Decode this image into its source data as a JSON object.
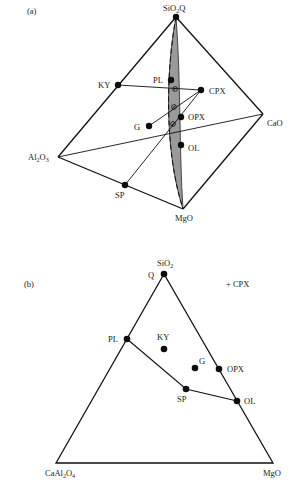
{
  "panel_a": {
    "label": "(a)",
    "title": "CMAS tetrahedron",
    "vertices": {
      "apex": {
        "label": "SiO",
        "sub": "2",
        "suffix": "Q",
        "x": 176,
        "y": 17
      },
      "al2o3": {
        "label": "Al",
        "sub1": "2",
        "mid": "O",
        "sub2": "3",
        "x": 58,
        "y": 157
      },
      "cao": {
        "label": "CaO",
        "x": 263,
        "y": 114
      },
      "mgo": {
        "label": "MgO",
        "x": 183,
        "y": 209
      }
    },
    "phases": [
      {
        "name": "KY",
        "x": 118,
        "y": 85
      },
      {
        "name": "PL",
        "x": 171,
        "y": 80
      },
      {
        "name": "CPX",
        "x": 201,
        "y": 90
      },
      {
        "name": "OPX",
        "x": 181,
        "y": 117
      },
      {
        "name": "G",
        "x": 149,
        "y": 126
      },
      {
        "name": "OL",
        "x": 181,
        "y": 145
      },
      {
        "name": "SP",
        "x": 125,
        "y": 185
      }
    ],
    "projection_points": [
      {
        "x": 175,
        "y": 89
      },
      {
        "x": 174,
        "y": 107
      },
      {
        "x": 173,
        "y": 124
      }
    ],
    "shade_color": "#9a9a9a"
  },
  "panel_b": {
    "label": "(b)",
    "note": "+ CPX",
    "vertices": {
      "top": {
        "label": "SiO",
        "sub": "2",
        "point_label": "Q",
        "x": 164,
        "y": 274
      },
      "left": {
        "label": "CaAl",
        "sub1": "2",
        "mid": "O",
        "sub2": "4",
        "x": 56,
        "y": 463
      },
      "right": {
        "label": "MgO",
        "x": 273,
        "y": 463
      }
    },
    "phases": [
      {
        "name": "PL",
        "x": 127,
        "y": 339
      },
      {
        "name": "KY",
        "x": 164,
        "y": 349
      },
      {
        "name": "G",
        "x": 195,
        "y": 368
      },
      {
        "name": "OPX",
        "x": 219,
        "y": 369
      },
      {
        "name": "SP",
        "x": 186,
        "y": 389
      },
      {
        "name": "OL",
        "x": 237,
        "y": 401
      }
    ],
    "tie_lines": [
      [
        "PL",
        "SP"
      ],
      [
        "SP",
        "OL"
      ]
    ]
  }
}
